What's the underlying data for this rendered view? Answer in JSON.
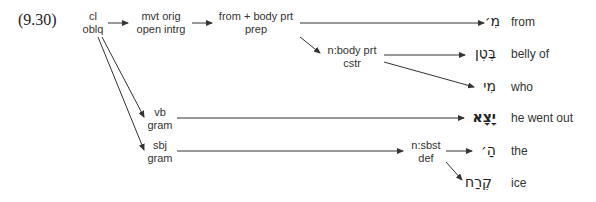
{
  "example_number": "(9.30)",
  "nodes": {
    "root": {
      "line1": "cl",
      "line2": "oblq"
    },
    "mvt": {
      "line1": "mvt orig",
      "line2": "open intrg"
    },
    "prep": {
      "line1": "from + body prt",
      "line2": "prep"
    },
    "body": {
      "line1": "n:body prt",
      "line2": "cstr"
    },
    "vb": {
      "line1": "vb",
      "line2": "gram"
    },
    "sbj": {
      "line1": "sbj",
      "line2": "gram"
    },
    "sbst": {
      "line1": "n:sbst",
      "line2": "def"
    }
  },
  "words": [
    {
      "hebrew": "מִ׳",
      "gloss": "from"
    },
    {
      "hebrew": "בֶּטֶן",
      "gloss": "belly of"
    },
    {
      "hebrew": "מִי",
      "gloss": "who"
    },
    {
      "hebrew": "יָצָא",
      "gloss": "he went out"
    },
    {
      "hebrew": "הַ׳",
      "gloss": "the"
    },
    {
      "hebrew": "קֶרַח",
      "gloss": "ice"
    }
  ],
  "colors": {
    "line": "#333333",
    "text": "#333333"
  }
}
